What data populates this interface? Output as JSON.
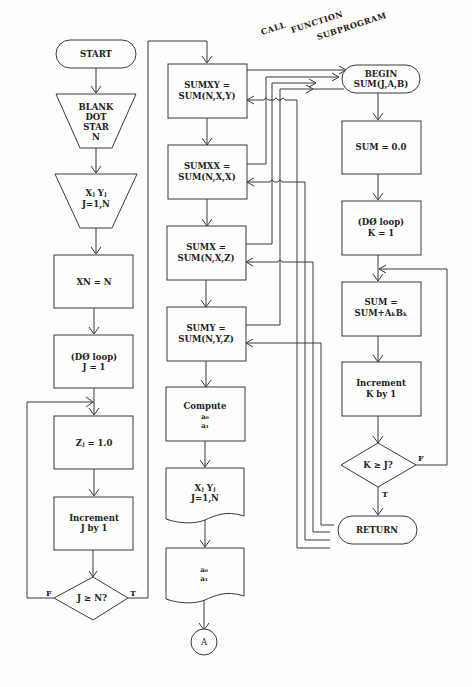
{
  "diagram": {
    "main_flow": {
      "start": "START",
      "blank_dot_star": [
        "BLANK",
        "DOT",
        "STAR",
        "N"
      ],
      "read_xy": [
        "Xⱼ  Yⱼ",
        "J=1,N"
      ],
      "xn": "XN = N",
      "do_loop_j": [
        "(DØ loop)",
        "J = 1"
      ],
      "zj": "Zⱼ = 1.0",
      "increment_j": [
        "Increment",
        "J by 1"
      ],
      "decision_j": "J ≥ N?",
      "decision_j_false": "F",
      "decision_j_true": "T"
    },
    "middle_flow": {
      "sumxy": [
        "SUMXY =",
        "SUM(N,X,Y)"
      ],
      "sumxx": [
        "SUMXX =",
        "SUM(N,X,X)"
      ],
      "sumx": [
        "SUMX =",
        "SUM(N,X,Z)"
      ],
      "sumy": [
        "SUMY =",
        "SUM(N,Y,Z)"
      ],
      "compute": [
        "Compute",
        "a₀",
        "a₁"
      ],
      "print_xy": [
        "Xⱼ  Yⱼ",
        "J=1,N"
      ],
      "print_a": [
        "a₀",
        "a₁"
      ],
      "connector": "A"
    },
    "call_label": [
      "CALL",
      "FUNCTION",
      "SUBPROGRAM"
    ],
    "subprogram": {
      "begin": [
        "BEGIN",
        "SUM(J,A,B)"
      ],
      "init": "SUM = 0.0",
      "do_loop_k": [
        "(DØ loop)",
        "K = 1"
      ],
      "accumulate": [
        "SUM =",
        "SUM+AₖBₖ"
      ],
      "increment_k": [
        "Increment",
        "K by 1"
      ],
      "decision_k": "K ≥ J?",
      "decision_k_false": "F",
      "decision_k_true": "T",
      "return": "RETURN"
    }
  }
}
